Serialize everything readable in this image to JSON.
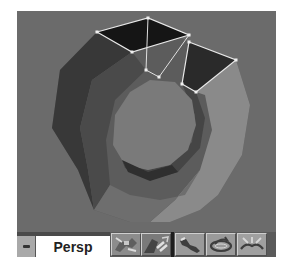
{
  "viewport": {
    "label": "Persp",
    "background_color": "#6b6b6b",
    "object": "torus-like ring mesh with two selected polygons",
    "selection_color": "#e8e8e8"
  },
  "toolbar": {
    "minimize_label": "-",
    "view_label": "Persp",
    "groups": [
      {
        "buttons": [
          {
            "name": "move-view",
            "icon": "move-icon"
          },
          {
            "name": "zoom-view",
            "icon": "zoom-icon"
          }
        ]
      },
      {
        "buttons": [
          {
            "name": "pan-view",
            "icon": "pan-icon"
          },
          {
            "name": "orbit-view",
            "icon": "orbit-icon"
          },
          {
            "name": "fit-view",
            "icon": "fit-icon"
          }
        ]
      }
    ]
  }
}
